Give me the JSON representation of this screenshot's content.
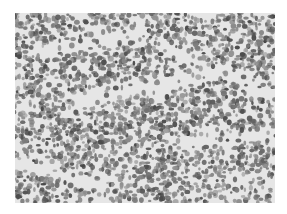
{
  "image": {
    "kind": "grayscale histology micrograph",
    "description": "Densely packed small round cells with scattered pale stromal channels",
    "colors": {
      "background": "#ffffff",
      "tissue_light": "#d8d8d8",
      "cell_mid": "#8a8a8a",
      "cell_dark": "#555555",
      "stroma": "#f2f2f2"
    }
  }
}
